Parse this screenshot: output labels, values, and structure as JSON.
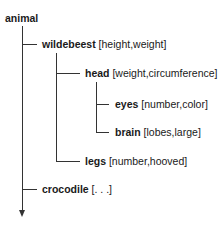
{
  "diagram": {
    "type": "tree",
    "root": {
      "name": "animal",
      "attrs": ""
    },
    "nodes": [
      {
        "name": "wildebeest",
        "attrs": "[height,weight]",
        "level": 1,
        "parent": "animal"
      },
      {
        "name": "head",
        "attrs": "[weight,circumference]",
        "level": 2,
        "parent": "wildebeest"
      },
      {
        "name": "eyes",
        "attrs": "[number,color]",
        "level": 3,
        "parent": "head"
      },
      {
        "name": "brain",
        "attrs": "[lobes,large]",
        "level": 3,
        "parent": "head"
      },
      {
        "name": "legs",
        "attrs": "[number,hooved]",
        "level": 2,
        "parent": "wildebeest"
      },
      {
        "name": "crocodile",
        "attrs": "[. . .]",
        "level": 1,
        "parent": "animal"
      }
    ],
    "line_color": "#333333",
    "text_color": "#1a1a1a"
  }
}
